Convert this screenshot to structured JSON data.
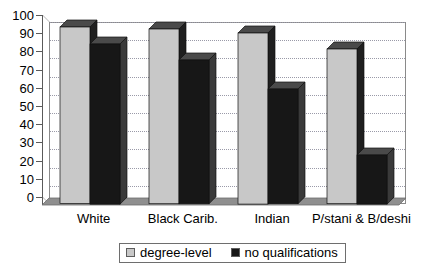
{
  "chart_data": {
    "type": "bar",
    "title": "",
    "subtitle": "",
    "xlabel": "",
    "ylabel": "",
    "ylim": [
      0,
      100
    ],
    "ytick_step": 10,
    "yticks": [
      "0",
      "10",
      "20",
      "30",
      "40",
      "50",
      "60",
      "70",
      "80",
      "90",
      "100"
    ],
    "grid": true,
    "grid_style": "dotted-horizontal",
    "legend_position": "bottom-center",
    "three_d": true,
    "categories": [
      "White",
      "Black Carib.",
      "Indian",
      "P/stani & B/deshi"
    ],
    "series": [
      {
        "name": "degree-level",
        "color": "#c8c8c8",
        "values": [
          97,
          96,
          94,
          85
        ]
      },
      {
        "name": "no qualifications",
        "color": "#171717",
        "values": [
          88,
          79,
          63,
          27
        ]
      }
    ]
  },
  "legend": {
    "entries": [
      {
        "label": "degree-level",
        "color": "#c8c8c8"
      },
      {
        "label": "no qualifications",
        "color": "#171717"
      }
    ]
  },
  "colors": {
    "series_light": "#c8c8c8",
    "series_light_top": "#4a4a4a",
    "series_light_side": "#1f1f1f",
    "series_dark": "#171717",
    "series_dark_top": "#4a4a4a",
    "series_dark_side": "#3a3a3a",
    "gridline": "#9a9aa8",
    "axis": "#5a5a5a",
    "frame": "#8a8a8a",
    "floor": "#8f8f8f",
    "background": "#ffffff",
    "text": "#000000"
  }
}
